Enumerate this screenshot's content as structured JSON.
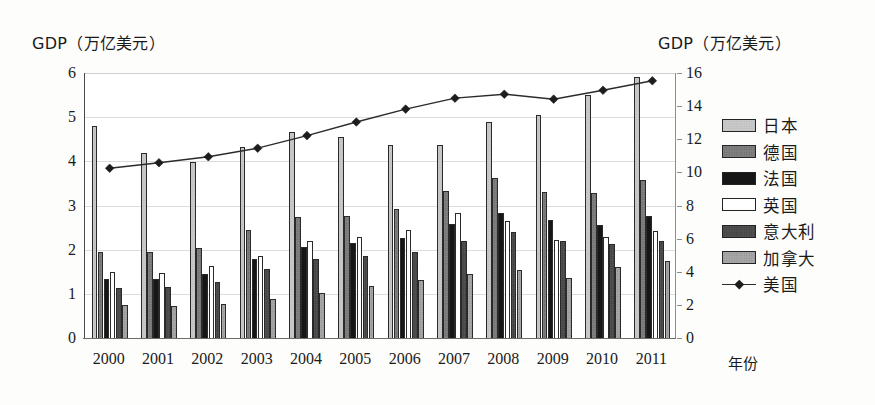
{
  "chart_data": {
    "type": "bar",
    "title": "",
    "xlabel": "年份",
    "ylabel_left": "GDP（万亿美元）",
    "ylabel_right": "GDP（万亿美元）",
    "grid": true,
    "legend_position": "right",
    "categories": [
      "2000",
      "2001",
      "2002",
      "2003",
      "2004",
      "2005",
      "2006",
      "2007",
      "2008",
      "2009",
      "2010",
      "2011"
    ],
    "left_axis": {
      "min": 0,
      "max": 6,
      "step": 1,
      "ticks": [
        "0",
        "1",
        "2",
        "3",
        "4",
        "5",
        "6"
      ]
    },
    "right_axis": {
      "min": 0,
      "max": 16,
      "step": 2,
      "ticks": [
        "0",
        "2",
        "4",
        "6",
        "8",
        "10",
        "12",
        "14",
        "16"
      ]
    },
    "series": [
      {
        "name": "日本",
        "axis": "left",
        "kind": "bar",
        "pattern": "light-dot",
        "values": [
          4.79,
          4.19,
          3.98,
          4.32,
          4.66,
          4.56,
          4.36,
          4.36,
          4.88,
          5.04,
          5.5,
          5.91
        ]
      },
      {
        "name": "德国",
        "axis": "left",
        "kind": "bar",
        "pattern": "mid-dot",
        "values": [
          1.95,
          1.94,
          2.03,
          2.44,
          2.73,
          2.77,
          2.92,
          3.32,
          3.62,
          3.3,
          3.28,
          3.58
        ]
      },
      {
        "name": "法国",
        "axis": "left",
        "kind": "bar",
        "pattern": "solid-black",
        "values": [
          1.33,
          1.34,
          1.46,
          1.8,
          2.06,
          2.14,
          2.26,
          2.58,
          2.83,
          2.67,
          2.56,
          2.77
        ]
      },
      {
        "name": "英国",
        "axis": "left",
        "kind": "bar",
        "pattern": "white",
        "values": [
          1.5,
          1.47,
          1.62,
          1.86,
          2.2,
          2.28,
          2.44,
          2.84,
          2.66,
          2.21,
          2.29,
          2.43
        ]
      },
      {
        "name": "意大利",
        "axis": "left",
        "kind": "bar",
        "pattern": "dark-dot",
        "values": [
          1.14,
          1.16,
          1.27,
          1.57,
          1.8,
          1.85,
          1.95,
          2.2,
          2.39,
          2.19,
          2.13,
          2.19
        ]
      },
      {
        "name": "加拿大",
        "axis": "left",
        "kind": "bar",
        "pattern": "grey-dot",
        "values": [
          0.74,
          0.73,
          0.76,
          0.89,
          1.02,
          1.17,
          1.32,
          1.46,
          1.54,
          1.37,
          1.61,
          1.74
        ]
      },
      {
        "name": "美国",
        "axis": "right",
        "kind": "line",
        "pattern": "diamond",
        "values": [
          10.25,
          10.58,
          10.94,
          11.46,
          12.22,
          13.04,
          13.82,
          14.48,
          14.72,
          14.42,
          14.96,
          15.53
        ]
      }
    ]
  }
}
